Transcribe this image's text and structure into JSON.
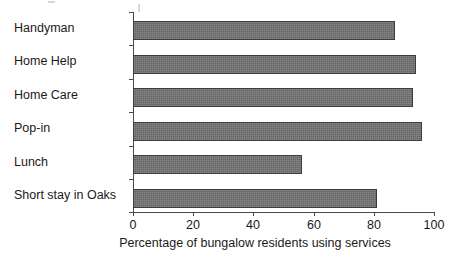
{
  "chart_data": {
    "type": "bar",
    "orientation": "horizontal",
    "title": "",
    "xlabel": "Percentage of bungalow residents using services",
    "ylabel": "",
    "categories": [
      "Handyman",
      "Home Help",
      "Home Care",
      "Pop-in",
      "Lunch",
      "Short stay in Oaks"
    ],
    "values": [
      87,
      94,
      93,
      96,
      56,
      81
    ],
    "xlim": [
      0,
      100
    ],
    "xticks": [
      0,
      20,
      40,
      60,
      80,
      100
    ],
    "xtick_labels": [
      "0",
      "20",
      "40",
      "60",
      "80",
      "100"
    ],
    "grid": false,
    "legend": null,
    "colors": {
      "bar_fill": "#6e6e6e",
      "bar_border": "#3d3d3d",
      "axis": "#4a4a4a",
      "text": "#1a1a1a",
      "background": "#ffffff"
    }
  }
}
